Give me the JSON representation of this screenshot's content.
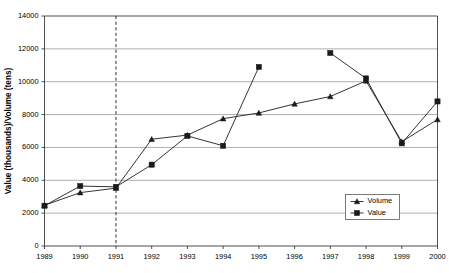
{
  "chart_data": {
    "type": "line",
    "title": "",
    "xlabel": "",
    "ylabel": "Value (thousands)/Volume (tens)",
    "x": [
      1989,
      1990,
      1991,
      1992,
      1993,
      1994,
      1995,
      1996,
      1997,
      1998,
      1999,
      2000
    ],
    "categories": [
      "1989",
      "1990",
      "1991",
      "1992",
      "1993",
      "1994",
      "1995",
      "1996",
      "1997",
      "1998",
      "1999",
      "2000"
    ],
    "xlim": [
      1989,
      2000
    ],
    "ylim": [
      0,
      14000
    ],
    "yticks": [
      0,
      2000,
      4000,
      6000,
      8000,
      10000,
      12000,
      14000
    ],
    "ytick_labels": [
      "0",
      "2000",
      "4000",
      "6000",
      "8000",
      "10000",
      "12000",
      "14000"
    ],
    "grid": "horizontal",
    "legend_position": "bottom-right",
    "series": [
      {
        "name": "Volume",
        "marker": "triangle",
        "values": [
          2480,
          3250,
          3520,
          6500,
          6750,
          7750,
          8100,
          8650,
          9100,
          10050,
          6350,
          7700
        ]
      },
      {
        "name": "Value",
        "marker": "square",
        "values": [
          2450,
          3650,
          3600,
          4950,
          6700,
          6100,
          10900,
          null,
          11750,
          10200,
          6250,
          8800
        ]
      }
    ],
    "annotations": [
      {
        "type": "vertical-reference-line",
        "x": 1991,
        "style": "dashed",
        "label": ""
      }
    ]
  },
  "legend": {
    "entries": [
      {
        "label": "Volume",
        "marker": "triangle-marker"
      },
      {
        "label": "Value",
        "marker": "square-marker"
      }
    ]
  }
}
